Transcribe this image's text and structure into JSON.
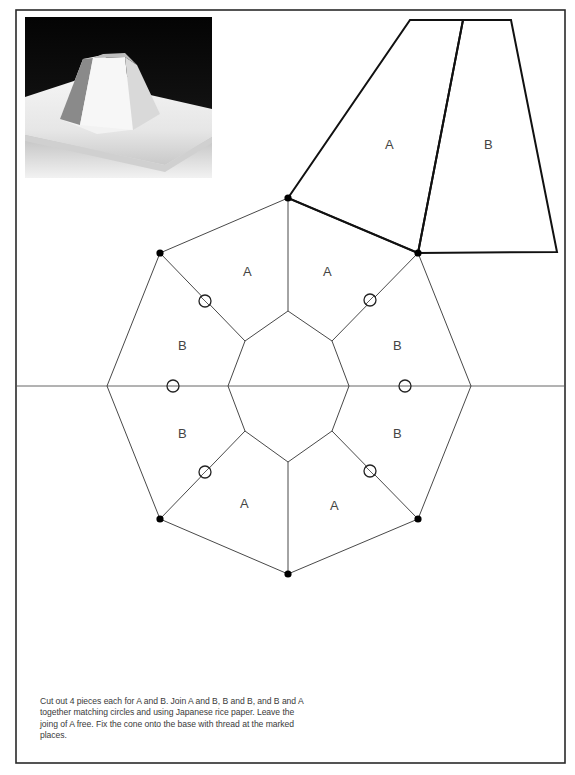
{
  "photo": {
    "description": "photograph of white paper octagonal cone model on base sheet, black background"
  },
  "pattern_pieces": {
    "top_piece_a_label": "A",
    "top_piece_b_label": "B"
  },
  "octagon": {
    "segment_labels": [
      "A",
      "A",
      "B",
      "B",
      "B",
      "B",
      "A",
      "A"
    ]
  },
  "caption": {
    "text": "Cut out 4 pieces each for A and B. Join A and B, B and B, and B and A together matching circles and using Japanese rice paper. Leave the joing of A free. Fix the cone onto the base with thread at the marked places."
  },
  "colors": {
    "line": "#1a1a1a",
    "label": "#444444",
    "caption": "#3a3a3a",
    "background": "#ffffff"
  }
}
